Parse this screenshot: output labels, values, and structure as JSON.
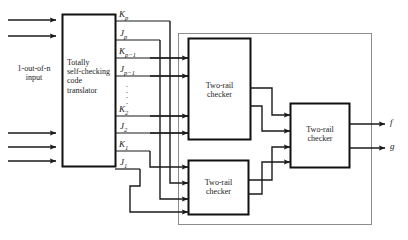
{
  "figure": {
    "type": "block-diagram"
  },
  "input": {
    "label_line1": "1-out-of-n",
    "label_line2": "input",
    "arrow_count": 5
  },
  "translator": {
    "line1": "Totally",
    "line2": "self-checking",
    "line3": "code",
    "line4": "translator"
  },
  "signals": [
    {
      "base": "K",
      "sub": "p"
    },
    {
      "base": "J",
      "sub": "p"
    },
    {
      "base": "K",
      "sub": "p−1"
    },
    {
      "base": "J",
      "sub": "p−1"
    },
    {
      "base": "K",
      "sub": "2"
    },
    {
      "base": "J",
      "sub": "2"
    },
    {
      "base": "K",
      "sub": "1"
    },
    {
      "base": "J",
      "sub": "1"
    }
  ],
  "ellipsis": "·\n·\n·",
  "checkers": {
    "upper": {
      "line1": "Two-rail",
      "line2": "checker"
    },
    "lower": {
      "line1": "Two-rail",
      "line2": "checker"
    },
    "right": {
      "line1": "Two-rail",
      "line2": "checker"
    }
  },
  "outputs": [
    {
      "name": "f"
    },
    {
      "name": "g"
    }
  ],
  "colors": {
    "line": "#1a1a1a",
    "frame": "#8c8c8c",
    "box_border": "#111111",
    "background": "#ffffff",
    "text": "#1a1a1a"
  }
}
